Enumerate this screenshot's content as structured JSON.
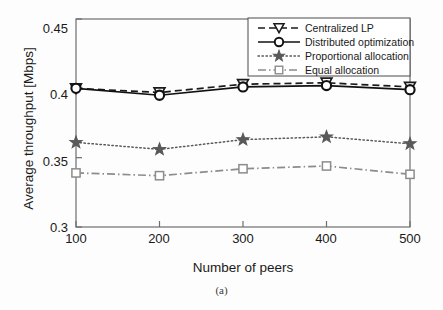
{
  "figure": {
    "caption": "(a)",
    "background_color": "#fdfdfd",
    "axis_color": "#6e6e6e"
  },
  "axes": {
    "ylabel": "Average throughput [Mbps]",
    "xlabel": "Number of peers",
    "yticks": [
      "0.3",
      "0.35",
      "0.4",
      "0.45"
    ],
    "xticks": [
      "100",
      "200",
      "300",
      "400",
      "500"
    ]
  },
  "legend": {
    "items": [
      {
        "label": "Centralized LP",
        "marker": "triangle-down-icon",
        "style": "dashed",
        "color": "#1a1a1a"
      },
      {
        "label": "Distributed optimization",
        "marker": "circle-icon",
        "style": "solid",
        "color": "#111111"
      },
      {
        "label": "Proportional allocation",
        "marker": "star-icon",
        "style": "dotted",
        "color": "#595959"
      },
      {
        "label": "Equal allocation",
        "marker": "square-icon",
        "style": "dashdot",
        "color": "#8c8c8c"
      }
    ]
  },
  "chart_data": {
    "type": "line",
    "title": "",
    "xlabel": "Number of peers",
    "ylabel": "Average throughput [Mbps]",
    "x": [
      100,
      200,
      300,
      400,
      500
    ],
    "xlim": [
      100,
      500
    ],
    "ylim": [
      0.3,
      0.45
    ],
    "ytick_values": [
      0.3,
      0.35,
      0.4,
      0.45
    ],
    "grid": false,
    "legend_position": "top-right",
    "series": [
      {
        "name": "Centralized LP",
        "values": [
          0.4,
          0.397,
          0.403,
          0.404,
          0.401
        ],
        "marker": "triangle-down",
        "linestyle": "dashed",
        "color": "#1a1a1a"
      },
      {
        "name": "Distributed optimization",
        "values": [
          0.4,
          0.395,
          0.401,
          0.402,
          0.399
        ],
        "marker": "circle",
        "linestyle": "solid",
        "color": "#111111"
      },
      {
        "name": "Proportional allocation",
        "values": [
          0.361,
          0.356,
          0.363,
          0.365,
          0.36
        ],
        "marker": "star",
        "linestyle": "dotted",
        "color": "#595959"
      },
      {
        "name": "Equal allocation",
        "values": [
          0.339,
          0.337,
          0.342,
          0.344,
          0.338
        ],
        "marker": "square",
        "linestyle": "dashdot",
        "color": "#8c8c8c"
      }
    ]
  }
}
